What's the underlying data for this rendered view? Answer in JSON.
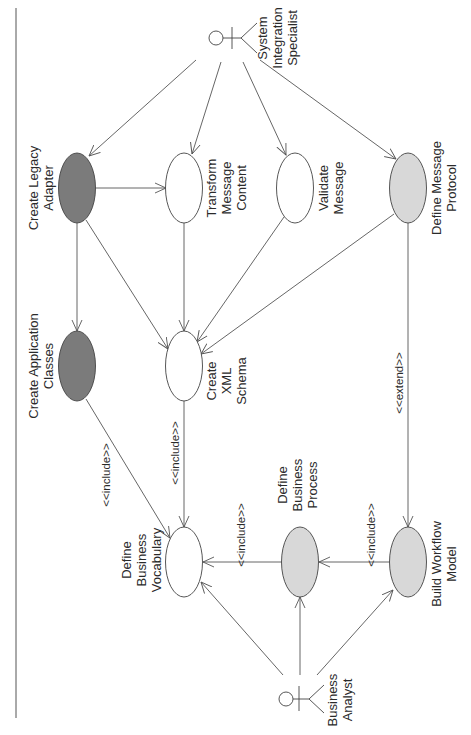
{
  "diagram": {
    "type": "UML use case diagram",
    "orientation": "rotated 90deg counter-clockwise",
    "colors": {
      "dark": "#7b7b7b",
      "light": "#d8d8d8",
      "white": "#ffffff",
      "line": "#555555"
    },
    "actors": [
      {
        "id": "sis",
        "label_lines": [
          "System",
          "Integration",
          "Specialist"
        ]
      },
      {
        "id": "ba",
        "label_lines": [
          "Business",
          "Analyst"
        ]
      }
    ],
    "use_cases": [
      {
        "id": "cla",
        "label_lines": [
          "Create Legacy",
          "Adapter"
        ],
        "fill": "dark"
      },
      {
        "id": "tmc",
        "label_lines": [
          "Transform",
          "Message",
          "Content"
        ],
        "fill": "white"
      },
      {
        "id": "vm",
        "label_lines": [
          "Validate",
          "Message"
        ],
        "fill": "white"
      },
      {
        "id": "dmp",
        "label_lines": [
          "Define Message",
          "Protocol"
        ],
        "fill": "light"
      },
      {
        "id": "cac",
        "label_lines": [
          "Create Application",
          "Classes"
        ],
        "fill": "dark"
      },
      {
        "id": "cxs",
        "label_lines": [
          "Create",
          "XML",
          "Schema"
        ],
        "fill": "white"
      },
      {
        "id": "dbv",
        "label_lines": [
          "Define",
          "Business",
          "Vocabulary"
        ],
        "fill": "white"
      },
      {
        "id": "dbp",
        "label_lines": [
          "Define",
          "Business",
          "Process"
        ],
        "fill": "light"
      },
      {
        "id": "bwm",
        "label_lines": [
          "Build Workflow",
          "Model"
        ],
        "fill": "light"
      }
    ],
    "relationships": [
      {
        "from": "sis",
        "to": "cla",
        "stereotype": ""
      },
      {
        "from": "sis",
        "to": "tmc",
        "stereotype": ""
      },
      {
        "from": "sis",
        "to": "vm",
        "stereotype": ""
      },
      {
        "from": "sis",
        "to": "dmp",
        "stereotype": ""
      },
      {
        "from": "cla",
        "to": "tmc",
        "stereotype": ""
      },
      {
        "from": "cla",
        "to": "cac",
        "stereotype": ""
      },
      {
        "from": "cla",
        "to": "cxs",
        "stereotype": ""
      },
      {
        "from": "tmc",
        "to": "cxs",
        "stereotype": ""
      },
      {
        "from": "vm",
        "to": "cxs",
        "stereotype": ""
      },
      {
        "from": "dmp",
        "to": "cxs",
        "stereotype": ""
      },
      {
        "from": "cac",
        "to": "dbv",
        "stereotype": "<<include>>"
      },
      {
        "from": "cxs",
        "to": "dbv",
        "stereotype": "<<include>>"
      },
      {
        "from": "dmp",
        "to": "bwm",
        "stereotype": "<<extend>>"
      },
      {
        "from": "dbp",
        "to": "dbv",
        "stereotype": "<<include>>"
      },
      {
        "from": "bwm",
        "to": "dbp",
        "stereotype": "<<include>>"
      },
      {
        "from": "ba",
        "to": "dbv",
        "stereotype": ""
      },
      {
        "from": "ba",
        "to": "dbp",
        "stereotype": ""
      },
      {
        "from": "ba",
        "to": "bwm",
        "stereotype": ""
      }
    ],
    "stereotype_labels": {
      "cac_dbv": "<<include>>",
      "cxs_dbv": "<<include>>",
      "dmp_bwm": "<<extend>>",
      "dbp_dbv": "<<include>>",
      "bwm_dbp": "<<include>>"
    }
  }
}
